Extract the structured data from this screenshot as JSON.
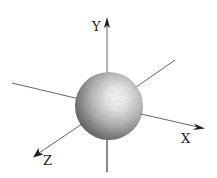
{
  "diagram": {
    "axes": [
      {
        "name": "Y",
        "label": "Y"
      },
      {
        "name": "X",
        "label": "X"
      },
      {
        "name": "Z",
        "label": "Z"
      }
    ],
    "object": "sphere",
    "colors": {
      "axis": "#555555",
      "arrowhead": "#222222",
      "label": "#222222",
      "sphere_highlight": "#ffffff",
      "sphere_shadow": "#5a5a5a"
    }
  }
}
